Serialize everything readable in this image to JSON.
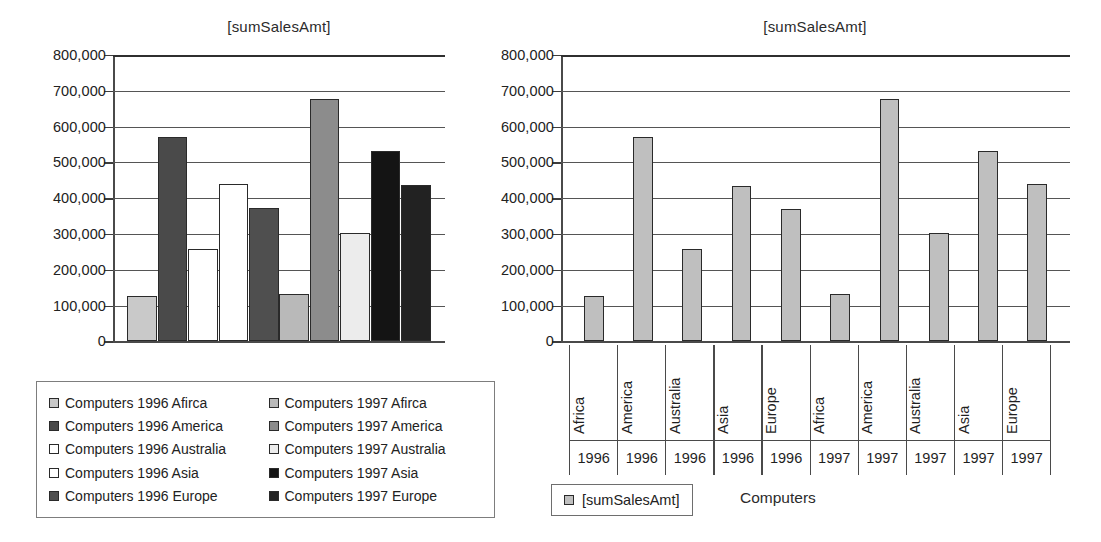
{
  "chart_data": [
    {
      "id": "left",
      "type": "bar",
      "title": "[sumSalesAmt]",
      "xlabel": "",
      "ylabel": "",
      "ylim": [
        0,
        800000
      ],
      "ytick_step": 100000,
      "ytick_labels": [
        "800,000",
        "700,000",
        "600,000",
        "500,000",
        "400,000",
        "300,000",
        "200,000",
        "100,000",
        "0"
      ],
      "ytick_values": [
        800000,
        700000,
        600000,
        500000,
        400000,
        300000,
        200000,
        100000,
        0
      ],
      "grid": true,
      "legend_position": "below",
      "categories": [
        "Computers 1996 Afirca",
        "Computers 1996 America",
        "Computers 1996 Australia",
        "Computers 1996 Asia",
        "Computers 1996 Europe",
        "Computers 1997 Afirca",
        "Computers 1997 America",
        "Computers 1997 Australia",
        "Computers 1997 Asia",
        "Computers 1997 Europe"
      ],
      "values": [
        127000,
        572000,
        258000,
        439000,
        374000,
        133000,
        676000,
        302000,
        533000,
        438000
      ],
      "bar_colors": [
        "#c9c9c9",
        "#4a4a4a",
        "#ffffff",
        "#ffffff",
        "#4f4f4f",
        "#b9b9b9",
        "#8c8c8c",
        "#ececec",
        "#141414",
        "#222222"
      ],
      "legend": [
        {
          "label": "Computers 1996 Afirca",
          "color": "#c9c9c9"
        },
        {
          "label": "Computers 1997 Afirca",
          "color": "#b9b9b9"
        },
        {
          "label": "Computers 1996 America",
          "color": "#4a4a4a"
        },
        {
          "label": "Computers 1997 America",
          "color": "#8c8c8c"
        },
        {
          "label": "Computers 1996 Australia",
          "color": "#ffffff"
        },
        {
          "label": "Computers 1997 Australia",
          "color": "#ececec"
        },
        {
          "label": "Computers 1996 Asia",
          "color": "#ffffff"
        },
        {
          "label": "Computers 1997 Asia",
          "color": "#141414"
        },
        {
          "label": "Computers 1996 Europe",
          "color": "#4f4f4f"
        },
        {
          "label": "Computers 1997 Europe",
          "color": "#222222"
        }
      ]
    },
    {
      "id": "right",
      "type": "bar",
      "title": "[sumSalesAmt]",
      "xlabel": "Computers",
      "ylabel": "",
      "ylim": [
        0,
        800000
      ],
      "ytick_step": 100000,
      "ytick_labels": [
        "800,000",
        "700,000",
        "600,000",
        "500,000",
        "400,000",
        "300,000",
        "200,000",
        "100,000",
        "0"
      ],
      "ytick_values": [
        800000,
        700000,
        600000,
        500000,
        400000,
        300000,
        200000,
        100000,
        0
      ],
      "grid": true,
      "legend_position": "below-left",
      "series_name": "[sumSalesAmt]",
      "series_color": "#bfbfbf",
      "categories": [
        {
          "region": "Africa",
          "year": "1996"
        },
        {
          "region": "America",
          "year": "1996"
        },
        {
          "region": "Australia",
          "year": "1996"
        },
        {
          "region": "Asia",
          "year": "1996"
        },
        {
          "region": "Europe",
          "year": "1996"
        },
        {
          "region": "Africa",
          "year": "1997"
        },
        {
          "region": "America",
          "year": "1997"
        },
        {
          "region": "Australia",
          "year": "1997"
        },
        {
          "region": "Asia",
          "year": "1997"
        },
        {
          "region": "Europe",
          "year": "1997"
        }
      ],
      "values": [
        128000,
        570000,
        259000,
        434000,
        369000,
        132000,
        678000,
        303000,
        532000,
        439000
      ]
    }
  ]
}
